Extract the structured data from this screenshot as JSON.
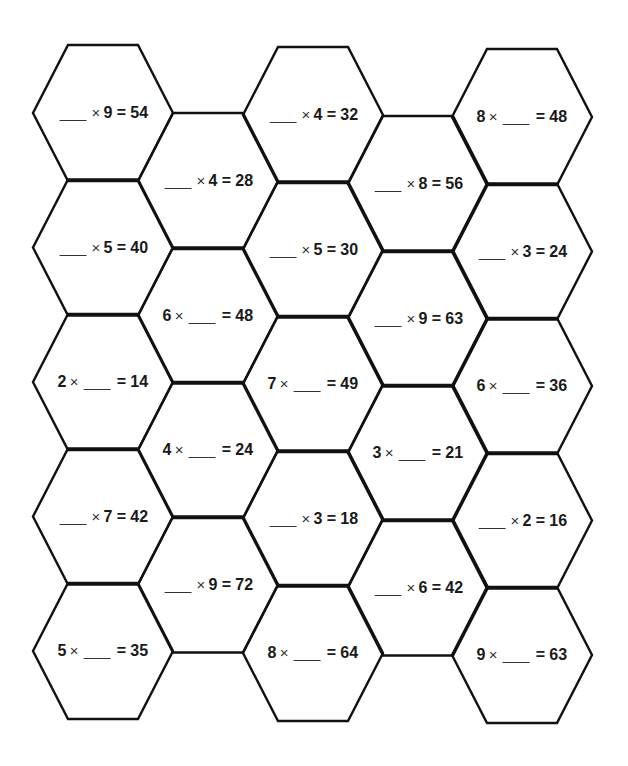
{
  "worksheet": {
    "type": "multiplication-missing-factor-hexagon-puzzle",
    "line_color": "#111111",
    "background": "#ffffff",
    "columns": [
      {
        "id": "A",
        "cells": [
          {
            "a": "",
            "b": "9",
            "product": "54"
          },
          {
            "a": "",
            "b": "5",
            "product": "40"
          },
          {
            "a": "2",
            "b": "",
            "product": "14"
          },
          {
            "a": "",
            "b": "7",
            "product": "42"
          },
          {
            "a": "5",
            "b": "",
            "product": "35"
          }
        ]
      },
      {
        "id": "B",
        "cells": [
          {
            "a": "",
            "b": "4",
            "product": "28"
          },
          {
            "a": "6",
            "b": "",
            "product": "48"
          },
          {
            "a": "4",
            "b": "",
            "product": "24"
          },
          {
            "a": "",
            "b": "9",
            "product": "72"
          }
        ]
      },
      {
        "id": "C",
        "cells": [
          {
            "a": "",
            "b": "4",
            "product": "32"
          },
          {
            "a": "",
            "b": "5",
            "product": "30"
          },
          {
            "a": "7",
            "b": "",
            "product": "49"
          },
          {
            "a": "",
            "b": "3",
            "product": "18"
          },
          {
            "a": "8",
            "b": "",
            "product": "64"
          }
        ]
      },
      {
        "id": "D",
        "cells": [
          {
            "a": "",
            "b": "8",
            "product": "56"
          },
          {
            "a": "",
            "b": "9",
            "product": "63"
          },
          {
            "a": "3",
            "b": "",
            "product": "21"
          },
          {
            "a": "",
            "b": "6",
            "product": "42"
          }
        ]
      },
      {
        "id": "E",
        "cells": [
          {
            "a": "8",
            "b": "",
            "product": "48"
          },
          {
            "a": "",
            "b": "3",
            "product": "24"
          },
          {
            "a": "6",
            "b": "",
            "product": "36"
          },
          {
            "a": "",
            "b": "2",
            "product": "16"
          },
          {
            "a": "9",
            "b": "",
            "product": "63"
          }
        ]
      }
    ],
    "symbols": {
      "times": "×",
      "equals": "="
    }
  }
}
